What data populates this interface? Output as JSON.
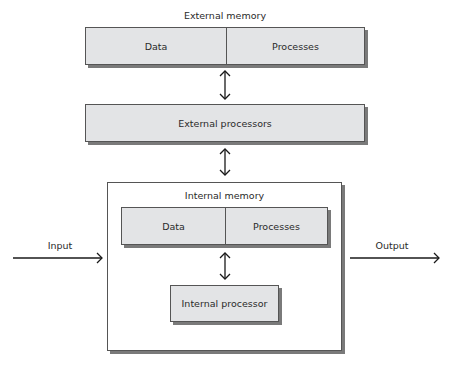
{
  "external_memory": {
    "title": "External memory",
    "cells": [
      {
        "label": "Data"
      },
      {
        "label": "Processes"
      }
    ]
  },
  "external_processors": {
    "label": "External processors"
  },
  "internal_system": {
    "title": "Internal memory",
    "memory_cells": [
      {
        "label": "Data"
      },
      {
        "label": "Processes"
      }
    ],
    "processor": {
      "label": "Internal processor"
    }
  },
  "io": {
    "input_label": "Input",
    "output_label": "Output"
  },
  "arrows": [
    {
      "from": "External memory",
      "to": "External processors",
      "type": "bidirectional"
    },
    {
      "from": "External processors",
      "to": "Internal memory",
      "type": "bidirectional"
    },
    {
      "from": "Internal memory",
      "to": "Internal processor",
      "type": "bidirectional"
    },
    {
      "from": "Input",
      "to": "Internal system",
      "type": "unidirectional"
    },
    {
      "from": "Internal system",
      "to": "Output",
      "type": "unidirectional"
    }
  ],
  "colors": {
    "box_fill": "#e3e4e6",
    "box_border": "#555555",
    "shadow": "#7a7a7a",
    "text": "#2a2a2a",
    "arrow": "#1a1a1a"
  }
}
